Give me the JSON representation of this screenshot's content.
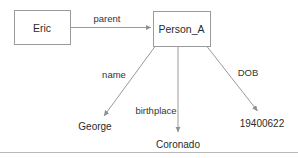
{
  "diagram": {
    "type": "knowledge-graph",
    "background_color": "#ffffff",
    "line_color": "#9a9a9a",
    "text_color": "#2b2b2b",
    "nodes": [
      {
        "id": "eric",
        "label": "Eric",
        "shape": "rectangle",
        "x": 42,
        "y": 27.5,
        "width": 56,
        "height": 34
      },
      {
        "id": "person_a",
        "label": "Person_A",
        "shape": "rectangle",
        "x": 181.5,
        "y": 28.5,
        "width": 57,
        "height": 35
      }
    ],
    "leaves": [
      {
        "id": "george",
        "label": "George",
        "x": 95,
        "y": 127
      },
      {
        "id": "coronado",
        "label": "Coronado",
        "x": 178,
        "y": 145
      },
      {
        "id": "dob_value",
        "label": "19400622",
        "x": 262,
        "y": 124
      }
    ],
    "edges": [
      {
        "id": "edge-parent",
        "label": "parent",
        "from": "eric",
        "to": "person_a",
        "label_x": 107,
        "label_y": 19
      },
      {
        "id": "edge-name",
        "label": "name",
        "from": "person_a",
        "to": "george",
        "label_x": 114,
        "label_y": 75
      },
      {
        "id": "edge-birthplace",
        "label": "birthplace",
        "from": "person_a",
        "to": "coronado",
        "label_x": 156,
        "label_y": 111
      },
      {
        "id": "edge-dob",
        "label": "DOB",
        "from": "person_a",
        "to": "dob_value",
        "label_x": 248,
        "label_y": 73
      }
    ],
    "divider": {
      "name": "bottom-rule",
      "color": "#b9b9b9"
    }
  }
}
